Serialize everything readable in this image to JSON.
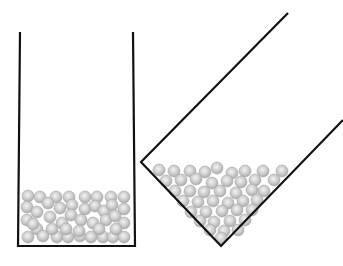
{
  "diagram": {
    "colors": {
      "background": "#ffffff",
      "container_stroke": "#111111",
      "sphere_fill": "#c8c8c8",
      "sphere_highlight": "#f2f2f2",
      "sphere_edge": "#a8a8a8"
    },
    "containers": [
      {
        "id": "upright",
        "walls": [
          [
            20,
            32
          ],
          [
            18,
            246
          ],
          [
            135,
            246
          ],
          [
            133,
            32
          ]
        ],
        "spheres": [
          [
            28,
            196
          ],
          [
            40,
            197
          ],
          [
            56,
            197
          ],
          [
            69,
            197
          ],
          [
            85,
            197
          ],
          [
            97,
            197
          ],
          [
            111,
            197
          ],
          [
            124,
            197
          ],
          [
            27,
            207
          ],
          [
            37,
            212
          ],
          [
            48,
            203
          ],
          [
            60,
            208
          ],
          [
            72,
            205
          ],
          [
            85,
            209
          ],
          [
            95,
            206
          ],
          [
            104,
            211
          ],
          [
            112,
            205
          ],
          [
            124,
            209
          ],
          [
            27,
            220
          ],
          [
            37,
            229
          ],
          [
            50,
            217
          ],
          [
            62,
            223
          ],
          [
            71,
            215
          ],
          [
            81,
            220
          ],
          [
            93,
            223
          ],
          [
            106,
            220
          ],
          [
            115,
            216
          ],
          [
            124,
            223
          ],
          [
            28,
            237
          ],
          [
            43,
            236
          ],
          [
            57,
            237
          ],
          [
            68,
            237
          ],
          [
            80,
            236
          ],
          [
            91,
            237
          ],
          [
            103,
            237
          ],
          [
            113,
            237
          ],
          [
            124,
            237
          ],
          [
            33,
            224
          ],
          [
            52,
            229
          ],
          [
            79,
            231
          ],
          [
            66,
            229
          ],
          [
            99,
            229
          ],
          [
            116,
            229
          ]
        ]
      },
      {
        "id": "tilted",
        "walls": [
          [
            288,
            13
          ],
          [
            141,
            162
          ],
          [
            221,
            246
          ],
          [
            343,
            120
          ]
        ],
        "spheres": [
          [
            159,
            170
          ],
          [
            174,
            171
          ],
          [
            190,
            171
          ],
          [
            205,
            172
          ],
          [
            217,
            168
          ],
          [
            232,
            173
          ],
          [
            245,
            171
          ],
          [
            263,
            171
          ],
          [
            282,
            171
          ],
          [
            166,
            181
          ],
          [
            181,
            180
          ],
          [
            196,
            179
          ],
          [
            212,
            183
          ],
          [
            227,
            181
          ],
          [
            241,
            182
          ],
          [
            255,
            180
          ],
          [
            274,
            180
          ],
          [
            175,
            191
          ],
          [
            190,
            191
          ],
          [
            204,
            192
          ],
          [
            220,
            191
          ],
          [
            236,
            193
          ],
          [
            252,
            190
          ],
          [
            264,
            191
          ],
          [
            183,
            201
          ],
          [
            198,
            202
          ],
          [
            213,
            201
          ],
          [
            228,
            203
          ],
          [
            243,
            201
          ],
          [
            257,
            200
          ],
          [
            191,
            212
          ],
          [
            206,
            212
          ],
          [
            222,
            211
          ],
          [
            237,
            210
          ],
          [
            252,
            210
          ],
          [
            200,
            221
          ],
          [
            214,
            222
          ],
          [
            230,
            221
          ],
          [
            245,
            220
          ],
          [
            210,
            230
          ],
          [
            224,
            231
          ],
          [
            238,
            230
          ],
          [
            221,
            238
          ]
        ]
      }
    ]
  }
}
